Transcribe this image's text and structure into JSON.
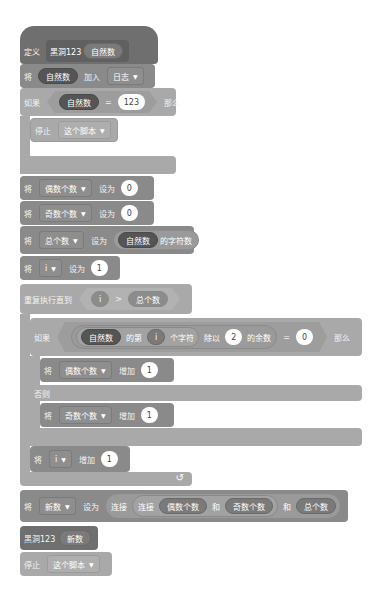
{
  "define": {
    "keyword": "定义",
    "block_name": "黑洞123",
    "param": "自然数"
  },
  "add_to_list": {
    "keyword": "将",
    "item": "自然数",
    "action": "加入",
    "list": "日志"
  },
  "if1": {
    "keyword": "如果",
    "left": "自然数",
    "op": "=",
    "right": "123",
    "then": "那么",
    "stop": {
      "keyword": "停止",
      "option": "这个脚本"
    }
  },
  "set_even": {
    "keyword": "将",
    "var": "偶数个数",
    "action": "设为",
    "value": "0"
  },
  "set_odd": {
    "keyword": "将",
    "var": "奇数个数",
    "action": "设为",
    "value": "0"
  },
  "set_total": {
    "keyword": "将",
    "var": "总个数",
    "action": "设为",
    "reporter": "自然数",
    "reporter_suffix": "的字符数"
  },
  "set_i": {
    "keyword": "将",
    "var": "i",
    "action": "设为",
    "value": "1"
  },
  "repeat": {
    "keyword": "重复执行直到",
    "left": "i",
    "op": ">",
    "right": "总个数"
  },
  "if2": {
    "keyword": "如果",
    "source": "自然数",
    "of": "的第",
    "index": "i",
    "char": "个字符",
    "mod": "除以",
    "divisor": "2",
    "remainder": "的余数",
    "op": "=",
    "right": "0",
    "then": "那么",
    "else": "否则",
    "then_block": {
      "keyword": "将",
      "var": "偶数个数",
      "action": "增加",
      "value": "1"
    },
    "else_block": {
      "keyword": "将",
      "var": "奇数个数",
      "action": "增加",
      "value": "1"
    }
  },
  "inc_i": {
    "keyword": "将",
    "var": "i",
    "action": "增加",
    "value": "1"
  },
  "loop_arrow": "↺",
  "set_new": {
    "keyword": "将",
    "var": "新数",
    "action": "设为",
    "join1": "连接",
    "join2": "连接",
    "a": "偶数个数",
    "and1": "和",
    "b": "奇数个数",
    "and2": "和",
    "c": "总个数"
  },
  "call": {
    "block_name": "黑洞123",
    "arg": "新数"
  },
  "stop_end": {
    "keyword": "停止",
    "option": "这个脚本"
  },
  "dropdown_arrow": "▼"
}
